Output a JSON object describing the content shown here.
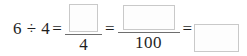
{
  "problem": {
    "type": "math-expression",
    "statement": "6 ÷ 4 = ?/4 = ?/100 = ?",
    "dividend": "6",
    "divide_symbol": "÷",
    "divisor": "4",
    "equals": "=",
    "terms": [
      {
        "kind": "expression",
        "text": "6 ÷ 4"
      },
      {
        "kind": "fraction",
        "numerator": "",
        "numerator_blank": true,
        "denominator": "4"
      },
      {
        "kind": "fraction",
        "numerator": "",
        "numerator_blank": true,
        "denominator": "100"
      },
      {
        "kind": "blank",
        "value": ""
      }
    ]
  },
  "colors": {
    "background": "#ffffff",
    "text": "#1f1f1f",
    "rule": "#6e6e6e",
    "box_border": "#c9c9c9",
    "box_fill": "#fdfdfd"
  }
}
